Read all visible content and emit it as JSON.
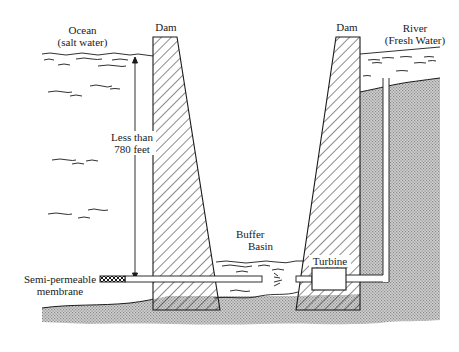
{
  "diagram": {
    "labels": {
      "ocean_line1": "Ocean",
      "ocean_line2": "(salt water)",
      "dam_left": "Dam",
      "dam_right": "Dam",
      "river_line1": "River",
      "river_line2": "(Fresh Water)",
      "height_line1": "Less than",
      "height_line2": "780 feet",
      "buffer_line1": "Buffer",
      "buffer_line2": "Basin",
      "turbine": "Turbine",
      "membrane_line1": "Semi-permeable",
      "membrane_line2": "membrane"
    },
    "colors": {
      "ink": "#1a1a1a",
      "ground": "#bdbdbd",
      "background": "#ffffff"
    }
  }
}
